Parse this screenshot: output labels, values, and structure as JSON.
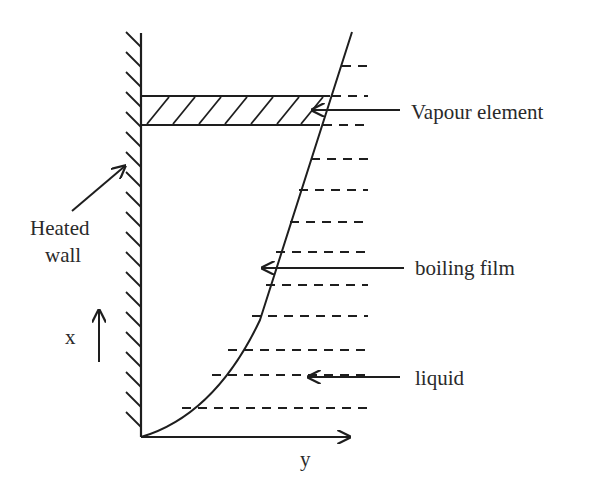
{
  "diagram": {
    "labels": {
      "vapour_element": "Vapour element",
      "heated_wall_line1": "Heated",
      "heated_wall_line2": "wall",
      "boiling_film": "boiling film",
      "liquid": "liquid",
      "x_axis": "x",
      "y_axis": "y"
    },
    "colors": {
      "stroke": "#1e1e1e",
      "text": "#2a2a2a",
      "background": "#ffffff"
    }
  }
}
